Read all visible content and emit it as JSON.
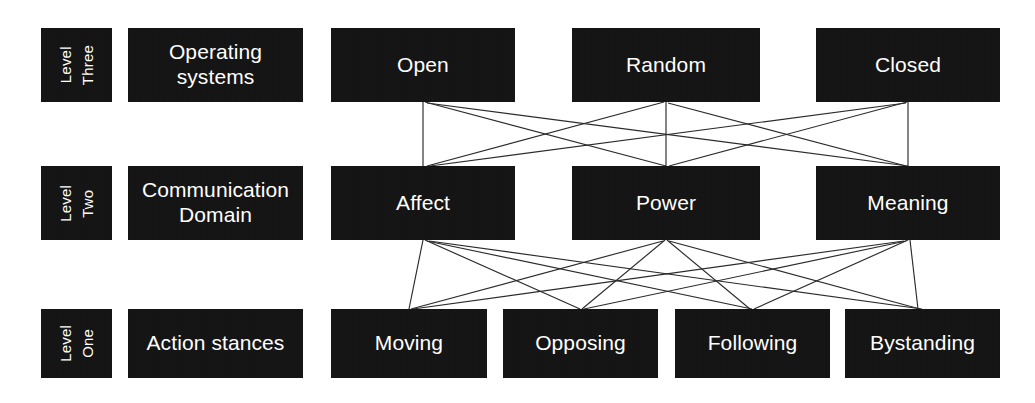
{
  "diagram": {
    "background_color": "#ffffff",
    "node_color": "#131313",
    "node_text_color": "#ffffff",
    "edge_color": "#2b2b2b",
    "levels": [
      {
        "id": "level-three",
        "tag": "Level\nThree",
        "tag_line1": "Level",
        "tag_line2": "Three",
        "row_label": "Operating systems",
        "nodes": [
          {
            "id": "open",
            "label": "Open"
          },
          {
            "id": "random",
            "label": "Random"
          },
          {
            "id": "closed",
            "label": "Closed"
          }
        ]
      },
      {
        "id": "level-two",
        "tag": "Level\nTwo",
        "tag_line1": "Level",
        "tag_line2": "Two",
        "row_label": "Communication Domain",
        "row_label_line1": "Communication",
        "row_label_line2": "Domain",
        "nodes": [
          {
            "id": "affect",
            "label": "Affect"
          },
          {
            "id": "power",
            "label": "Power"
          },
          {
            "id": "meaning",
            "label": "Meaning"
          }
        ]
      },
      {
        "id": "level-one",
        "tag": "Level\nOne",
        "tag_line1": "Level",
        "tag_line2": "One",
        "row_label": "Action stances",
        "nodes": [
          {
            "id": "moving",
            "label": "Moving"
          },
          {
            "id": "opposing",
            "label": "Opposing"
          },
          {
            "id": "following",
            "label": "Following"
          },
          {
            "id": "bystanding",
            "label": "Bystanding"
          }
        ]
      }
    ],
    "connections": {
      "level_three_to_two": [
        {
          "from": "open",
          "to": "affect"
        },
        {
          "from": "open",
          "to": "power"
        },
        {
          "from": "open",
          "to": "meaning"
        },
        {
          "from": "random",
          "to": "affect"
        },
        {
          "from": "random",
          "to": "power"
        },
        {
          "from": "random",
          "to": "meaning"
        },
        {
          "from": "closed",
          "to": "affect"
        },
        {
          "from": "closed",
          "to": "power"
        },
        {
          "from": "closed",
          "to": "meaning"
        }
      ],
      "level_two_to_one": [
        {
          "from": "affect",
          "to": "moving"
        },
        {
          "from": "affect",
          "to": "opposing"
        },
        {
          "from": "affect",
          "to": "following"
        },
        {
          "from": "affect",
          "to": "bystanding"
        },
        {
          "from": "power",
          "to": "moving"
        },
        {
          "from": "power",
          "to": "opposing"
        },
        {
          "from": "power",
          "to": "following"
        },
        {
          "from": "power",
          "to": "bystanding"
        },
        {
          "from": "meaning",
          "to": "moving"
        },
        {
          "from": "meaning",
          "to": "opposing"
        },
        {
          "from": "meaning",
          "to": "following"
        },
        {
          "from": "meaning",
          "to": "bystanding"
        }
      ]
    }
  }
}
